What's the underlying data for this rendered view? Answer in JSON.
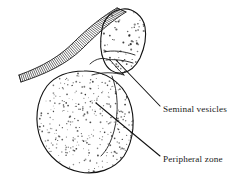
{
  "figure": {
    "type": "anatomical-line-drawing",
    "background_color": "#ffffff",
    "ink_color": "#111111",
    "labels": [
      {
        "id": "seminal-vesicles",
        "text": "Seminal vesicles",
        "text_x": 163,
        "text_y": 112,
        "leader": {
          "from_x": 116,
          "from_y": 60,
          "to_x": 160,
          "to_y": 106
        }
      },
      {
        "id": "peripheral-zone",
        "text": "Peripheral zone",
        "text_x": 163,
        "text_y": 162,
        "leader": {
          "from_x": 96,
          "from_y": 103,
          "to_x": 160,
          "to_y": 156
        }
      }
    ],
    "structures": [
      {
        "id": "prostate-gland",
        "name": "prostate-gland-outline",
        "shading": "fine-stipple",
        "stipple_count": 330,
        "center_x": 85,
        "center_y": 122,
        "radius_x": 47,
        "radius_y": 51
      },
      {
        "id": "seminal-vesicle",
        "name": "seminal-vesicle-outline",
        "shading": "coarse-stipple",
        "stipple_count": 70,
        "center_x": 121,
        "center_y": 42,
        "radius_x": 20,
        "radius_y": 35
      },
      {
        "id": "hatched-band",
        "name": "hatched-wall-band",
        "shading": "perpendicular-hatching",
        "hatch_count": 62,
        "description": "curved band running from upper right to lower left"
      }
    ]
  }
}
